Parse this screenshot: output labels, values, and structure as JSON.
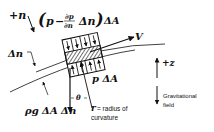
{
  "diagram": {
    "labels": {
      "plus_n": "+n",
      "top_force": "(p − ∂p/∂n Δn) ΔA",
      "top_force_p": "p",
      "top_force_minus": "−",
      "top_force_dp": "∂p",
      "top_force_dn": "∂n",
      "top_force_delta_n": "Δn",
      "top_force_delta_a": "ΔA",
      "velocity": "V",
      "delta_n": "Δn",
      "bottom_force": "p ΔA",
      "plus_z": "+z",
      "gravitational_1": "Gravitational",
      "gravitational_2": "field",
      "theta": "θ",
      "weight": "ρg ΔA Δn",
      "radius_symbol": "r",
      "radius_1": "= radius of",
      "radius_2": "curvature"
    },
    "colors": {
      "ink": "#111111",
      "background": "#ffffff"
    }
  }
}
